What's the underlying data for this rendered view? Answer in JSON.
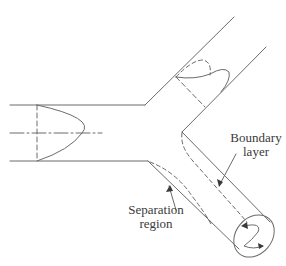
{
  "figure": {
    "colors": {
      "line": "#6b6b6b",
      "text": "#3a3a3a",
      "background": "#ffffff"
    }
  },
  "labels": {
    "boundary_layer": {
      "line1": "Boundary",
      "line2": "layer"
    },
    "separation_region": {
      "line1": "Separation",
      "line2": "region"
    }
  }
}
